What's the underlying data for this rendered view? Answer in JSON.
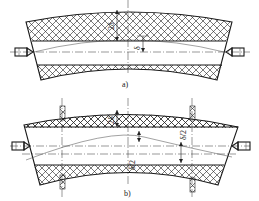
{
  "figure": {
    "subfigures": [
      {
        "id": "a",
        "caption": "a)",
        "dimension_labels": [
          "2δ",
          "δ"
        ],
        "description": "Curved bar with hatched top and bottom regions, held between two end centers"
      },
      {
        "id": "b",
        "caption": "b)",
        "dimension_labels": [
          "2δ",
          "δ/2",
          "δ/2"
        ],
        "description": "Curved bar with hatched regions, held between end centers and supported by two pairs of clamps"
      }
    ]
  },
  "colors": {
    "line": "#1a1a1a",
    "background": "#ffffff"
  }
}
